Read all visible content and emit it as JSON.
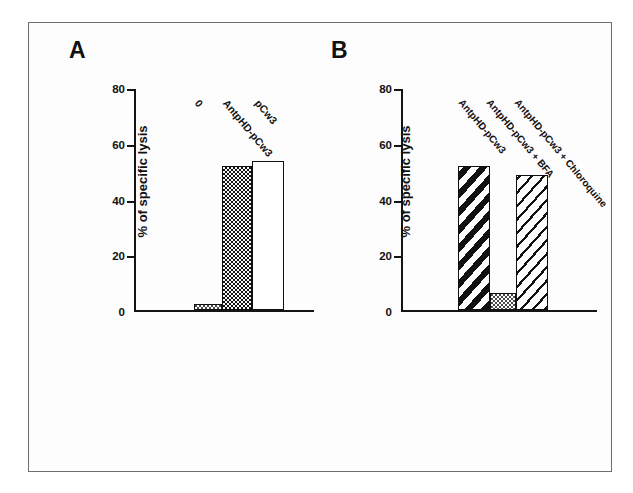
{
  "figure": {
    "panel_a_letter": "A",
    "panel_b_letter": "B"
  },
  "chart_data": [
    {
      "type": "bar",
      "panel": "A",
      "title": "A",
      "xlabel": "",
      "ylabel": "% of specific lysis",
      "ylim": [
        0,
        80
      ],
      "yticks": [
        0,
        20,
        40,
        60,
        80
      ],
      "ytick_labels": [
        "0",
        "20",
        "40",
        "60",
        "80"
      ],
      "grid": false,
      "legend": "none",
      "categories": [
        "0",
        "AntpHD-pCw3",
        "pCw3"
      ],
      "values": [
        2,
        52,
        54
      ],
      "bar_styles": [
        "light-stipple",
        "dark-stipple",
        "white"
      ]
    },
    {
      "type": "bar",
      "panel": "B",
      "title": "B",
      "xlabel": "",
      "ylabel": "% of specific lysis",
      "ylim": [
        0,
        80
      ],
      "yticks": [
        0,
        20,
        40,
        60,
        80
      ],
      "ytick_labels": [
        "0",
        "20",
        "40",
        "60",
        "80"
      ],
      "grid": false,
      "legend": "none",
      "categories": [
        "AntpHD-pCw3",
        "AntpHD-pCw3 + BFA",
        "AntpHD-pCw3 + Chloroquine"
      ],
      "values": [
        52,
        6,
        49
      ],
      "bar_styles": [
        "hatch-thick",
        "light-stipple",
        "hatch-thin"
      ]
    }
  ]
}
